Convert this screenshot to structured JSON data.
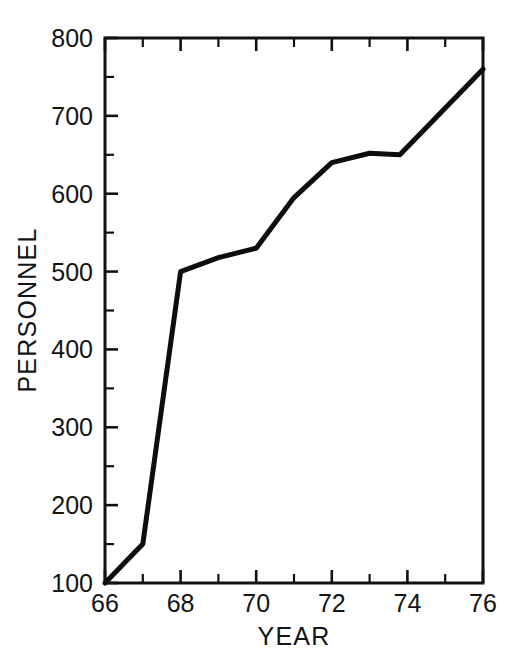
{
  "chart_data": {
    "type": "line",
    "title": "",
    "xlabel": "YEAR",
    "ylabel": "PERSONNEL",
    "xlim": [
      66,
      76
    ],
    "ylim": [
      100,
      800
    ],
    "grid": false,
    "legend": null,
    "x_major_ticks": [
      66,
      68,
      70,
      72,
      74,
      76
    ],
    "x_major_tick_labels": [
      "66",
      "68",
      "70",
      "72",
      "74",
      "76"
    ],
    "x_minor_ticks": [
      67,
      69,
      71,
      73,
      75
    ],
    "y_major_ticks": [
      100,
      200,
      300,
      400,
      500,
      600,
      700,
      800
    ],
    "y_major_tick_labels": [
      "100",
      "200",
      "300",
      "400",
      "500",
      "600",
      "700",
      "800"
    ],
    "y_minor_ticks": [
      150,
      250,
      350,
      450,
      550,
      650,
      750
    ],
    "series": [
      {
        "name": "Personnel",
        "color": "#0d0d0d",
        "x": [
          66,
          67,
          68,
          69,
          70,
          71,
          72,
          73,
          73.8,
          76
        ],
        "values": [
          100,
          150,
          500,
          518,
          530,
          595,
          640,
          652,
          650,
          760
        ]
      }
    ]
  },
  "axes": {
    "x_axis_label": "YEAR",
    "y_axis_label": "PERSONNEL"
  }
}
